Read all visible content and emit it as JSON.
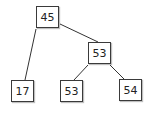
{
  "diagram": {
    "type": "binary-tree",
    "nodes": [
      {
        "id": "n1",
        "label": "45"
      },
      {
        "id": "n2",
        "label": "53"
      },
      {
        "id": "n3",
        "label": "17"
      },
      {
        "id": "n4",
        "label": "53"
      },
      {
        "id": "n5",
        "label": "54"
      }
    ],
    "edges": [
      {
        "from": "n1",
        "to": "n3"
      },
      {
        "from": "n1",
        "to": "n2"
      },
      {
        "from": "n2",
        "to": "n4"
      },
      {
        "from": "n2",
        "to": "n5"
      }
    ]
  }
}
